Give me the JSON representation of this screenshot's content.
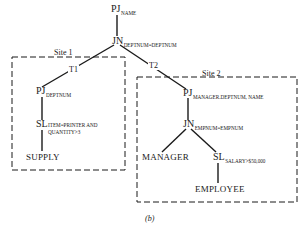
{
  "diagram": {
    "root": {
      "op": "PJ",
      "subscript": "NAME"
    },
    "join": {
      "op": "JN",
      "subscript": "DEPTNUM=DEPTNUM"
    },
    "edges": {
      "left": "T1",
      "right": "T2"
    },
    "site1": {
      "label": "Site 1",
      "project": {
        "op": "PJ",
        "subscript": "DEPTNUM"
      },
      "select": {
        "op": "SL",
        "subscript_line1": "ITEM=PRINTER AND",
        "subscript_line2": "QUANTITY>3"
      },
      "relation": "SUPPLY"
    },
    "site2": {
      "label": "Site 2",
      "project": {
        "op": "PJ",
        "subscript": "MANAGER.DEPTNUM, NAME"
      },
      "join": {
        "op": "JN",
        "subscript": "EMPNUM=EMPNUM"
      },
      "left_relation": "MANAGER",
      "select": {
        "op": "SL",
        "subscript": "SALARY>$50,000"
      },
      "right_relation": "EMPLOYEE"
    },
    "caption": "(b)"
  },
  "colors": {
    "ink": "#1a1a1a",
    "background": "#ffffff"
  }
}
